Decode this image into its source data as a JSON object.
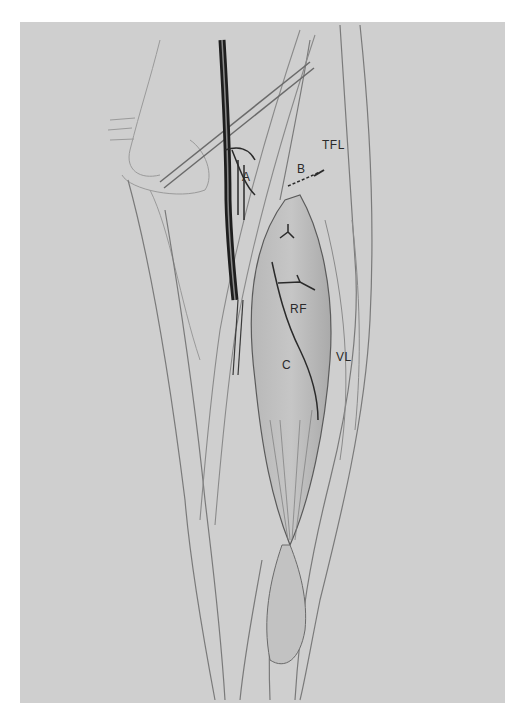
{
  "figure": {
    "background_color": "#cfcfcf",
    "labels": [
      {
        "id": "A",
        "text": "A",
        "x": 242,
        "y": 170
      },
      {
        "id": "B",
        "text": "B",
        "x": 297,
        "y": 162
      },
      {
        "id": "TFL",
        "text": "TFL",
        "x": 322,
        "y": 138
      },
      {
        "id": "RF",
        "text": "RF",
        "x": 290,
        "y": 302
      },
      {
        "id": "C",
        "text": "C",
        "x": 282,
        "y": 358
      },
      {
        "id": "VL",
        "text": "VL",
        "x": 336,
        "y": 350
      }
    ]
  }
}
